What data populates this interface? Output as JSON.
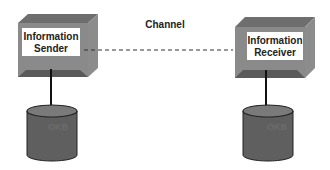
{
  "diagram": {
    "channel_label": "Channel",
    "sender": {
      "line1": "Information",
      "line2": "Sender",
      "db_label": "OKB"
    },
    "receiver": {
      "line1": "Information",
      "line2": "Receiver",
      "db_label": "OKB"
    },
    "colors": {
      "box_top": "#6e6e6e",
      "box_side": "#8c8c8c",
      "box_bottom": "#5a5a5a",
      "cylinder": "#5f5f5f",
      "cylinder_top": "#7a7a7a",
      "window": "#ffffff"
    }
  }
}
